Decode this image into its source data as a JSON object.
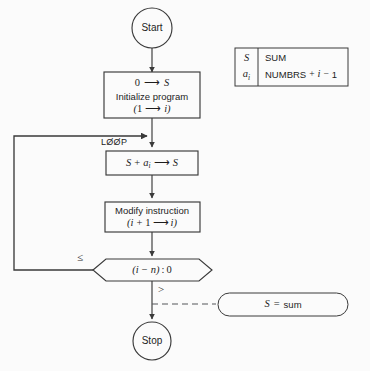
{
  "diagram": {
    "background_color": "#fbfbfb",
    "line_color": "#3a3a3a",
    "text_color": "#1d1d1d"
  },
  "nodes": {
    "start": {
      "label": "Start",
      "shape": "circle"
    },
    "initialize": {
      "line1": "0 → S",
      "line2": "Initialize program",
      "line3": "(1 → i)",
      "shape": "rectangle"
    },
    "loop_label": "LØØP",
    "accumulate": {
      "line1": "S + aᵢ → S",
      "shape": "rectangle"
    },
    "modify": {
      "line1": "Modify instruction",
      "line2": "(i + 1 → i)",
      "shape": "rectangle"
    },
    "decision": {
      "label": "(i − n) : 0",
      "shape": "hexagon",
      "branch_left": "≤",
      "branch_down": ">"
    },
    "annotation": {
      "label": "S = sum",
      "shape": "stadium"
    },
    "stop": {
      "label": "Stop",
      "shape": "circle"
    }
  },
  "legend": {
    "rows": [
      {
        "key": "S",
        "key_sub": "",
        "value": "SUM"
      },
      {
        "key": "a",
        "key_sub": "i",
        "value": "NUMBRS + i − 1"
      }
    ]
  }
}
